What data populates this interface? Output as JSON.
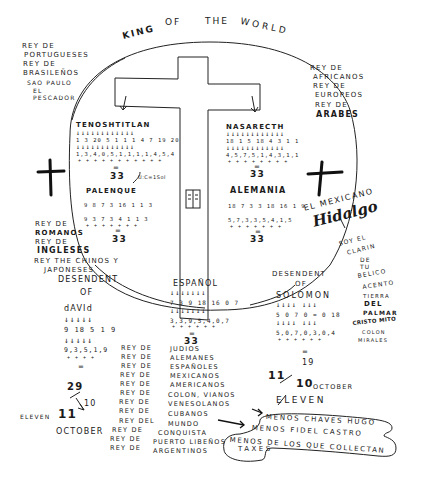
{
  "title": {
    "words": [
      "KING",
      "OF",
      "THE",
      "WORLD"
    ]
  },
  "left_top_text": [
    "REY DE",
    "PORTUGUESES",
    "REY DE",
    "BRASILEÑOS",
    "SAO PAULO",
    "EL",
    "PESCADOR"
  ],
  "right_top_text": [
    "REY DE",
    "AFRICANOS",
    "REY DE",
    "EUROPEOS",
    "REY DE",
    "ARABES"
  ],
  "circle": {
    "tenochtitlan": {
      "word": "TENOSHTITLAN",
      "arrows": "↓↓↓↓↓↓↓↓↓↓↓↓",
      "row1": "1 3 20 5 1 1 1 4 7 19 20",
      "row2": "1,3,4,0,5,1,1,1,1,4,5,4",
      "plus": "+ + + + + + + + + + +",
      "equals": "=",
      "total": "33",
      "note": "U:C=1Sol"
    },
    "nazareth": {
      "word": "NASARECTH",
      "row1": "18 1 5 18 4 3 1 1",
      "row2": "4,5,7,5,1,4,3,1,1",
      "plus": "+ + + + + + + +",
      "equals": "=",
      "total": "33"
    },
    "palenque": {
      "word": "PALENQUE",
      "row1": "9 8 7 3 16 1 1 3",
      "row2": "9 3 7 3 4 1 1 3",
      "plus": "+ + + + + + +",
      "equals": "=",
      "total": "33"
    },
    "alemania": {
      "word": "ALEMANIA",
      "row1": "18 7 3 3 18 16 1 9",
      "row2": "5,7,3,3,5,4,1,5",
      "plus": "+ + + + + + +",
      "equals": "=",
      "total": "33"
    }
  },
  "el_mexicano": {
    "label": "EL MEXICANO",
    "signature": "Hidalgo",
    "lines": [
      "SOY EL",
      "CLARIN",
      "DE",
      "TU",
      "BELICO",
      "ACENTO",
      "TIERRA",
      "DEL",
      "PALMAR",
      "CRISTO MITO",
      "COLON",
      "MIRALES"
    ]
  },
  "left_middle_text": [
    "REY DE",
    "ROMANOS",
    "REY DE",
    "INGLESES",
    "REY THE CHINOS Y",
    "JAPONESES"
  ],
  "david": {
    "heading": [
      "DESENDENT",
      "OF"
    ],
    "word": "dAVId",
    "arrows": "↓↓↓↓↓",
    "row1": "9 18 5 1 9",
    "row2": "9,3,5,1,9",
    "plus": "+ + + +",
    "equals": "=",
    "total": "29",
    "calc_a": "11",
    "calc_b": "10",
    "eleven_label": "ELEVEN",
    "october_label": "OCTOBER"
  },
  "espanol": {
    "word": "ESPAÑOL",
    "arrows": "↓↓↓↓↓↓↓",
    "row1": "7 3 9 18 16 0 7",
    "row2": "3,3,9,5,4,0,7",
    "plus": "+ + + + + +",
    "equals": "=",
    "total": "33"
  },
  "solomon": {
    "heading": [
      "DESENDENT",
      "OF"
    ],
    "word": "SOLOMON",
    "arrows": "↓↓↓↓ ↓↓↓",
    "row1": "5 0 7 0 = 0 18",
    "row2": "5,0,7,0,3,0,4",
    "plus": "+ + + + + +",
    "equals": "=",
    "total": "19",
    "calc_a": "11",
    "calc_b": "10",
    "october_label": "OCTOBER",
    "eleven_label": "ELEVEN"
  },
  "rey_column": [
    "REY DE",
    "REY DE",
    "REY DE",
    "REY DE",
    "REY DE",
    "REY DE",
    "REY DE",
    "REY DE",
    "REY DEL",
    "REY DE",
    "REY DE",
    "REY DE"
  ],
  "peoples_column": [
    "JUDIOS",
    "ALEMANES",
    "ESPAÑOLES",
    "MEXICANOS",
    "AMERICANOS",
    "COLON, VIANOS",
    "VENESOLANOS",
    "CUBANOS",
    "MUNDO",
    "CONQUISTA",
    "PUERTO LIBEÑOS",
    "ARGENTINOS"
  ],
  "bubble": {
    "line1": "MENOS CHAVES HUGO",
    "line2": "MENOS FIDEL CASTRO",
    "line3": "MENOS DE LOS QUE COLLECTAN",
    "line4": "TAXES"
  },
  "book_icon_label": "book",
  "colors": {
    "ink": "#1a1a1a",
    "paper": "#ffffff"
  }
}
